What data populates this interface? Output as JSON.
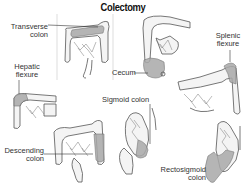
{
  "title": "Colectomy",
  "colors": {
    "outline": "#555555",
    "resected_segment": "#a9a9a9",
    "background": "#ffffff",
    "text": "#333333"
  },
  "panels": [
    {
      "id": "transverse",
      "label_line1": "Transverse",
      "label_line2": "colon"
    },
    {
      "id": "cecum",
      "label_line1": "Cecum",
      "label_line2": ""
    },
    {
      "id": "splenic",
      "label_line1": "Splenic",
      "label_line2": "flexure"
    },
    {
      "id": "hepatic",
      "label_line1": "Hepatic",
      "label_line2": "flexure"
    },
    {
      "id": "sigmoid",
      "label_line1": "Sigmoid colon",
      "label_line2": ""
    },
    {
      "id": "descending",
      "label_line1": "Descending",
      "label_line2": "colon"
    },
    {
      "id": "rectosigmoid",
      "label_line1": "Rectosigmoid",
      "label_line2": "colon"
    }
  ]
}
